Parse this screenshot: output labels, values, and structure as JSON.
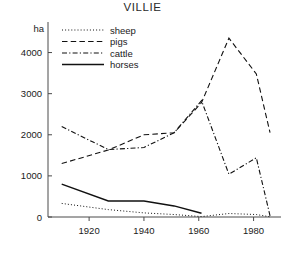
{
  "chart_data": {
    "type": "line",
    "title": "VILLIE",
    "xlabel": "",
    "ylabel": "ha",
    "xlim": [
      1905,
      1990
    ],
    "ylim": [
      0,
      4500
    ],
    "grid": false,
    "legend_position": "top-left",
    "xticks": [
      1920,
      1940,
      1960,
      1980
    ],
    "yticks": [
      0,
      1000,
      2000,
      3000,
      4000
    ],
    "series": [
      {
        "name": "sheep",
        "style": "dotted",
        "x": [
          1910,
          1927,
          1940,
          1951,
          1961,
          1971,
          1981,
          1986
        ],
        "values": [
          330,
          180,
          100,
          60,
          10,
          85,
          60,
          5
        ]
      },
      {
        "name": "pigs",
        "style": "dashed",
        "x": [
          1910,
          1927,
          1940,
          1951,
          1961,
          1971,
          1981,
          1986
        ],
        "values": [
          1300,
          1630,
          2000,
          2050,
          2780,
          4350,
          3480,
          2050
        ]
      },
      {
        "name": "cattle",
        "style": "dash-dot",
        "x": [
          1910,
          1927,
          1940,
          1951,
          1961,
          1971,
          1981,
          1986
        ],
        "values": [
          2200,
          1640,
          1690,
          2050,
          2830,
          1040,
          1440,
          30
        ]
      },
      {
        "name": "horses",
        "style": "solid",
        "x": [
          1910,
          1927,
          1940,
          1951,
          1961
        ],
        "values": [
          800,
          390,
          390,
          270,
          90
        ]
      }
    ]
  },
  "axes": {
    "y_unit_label": "ha",
    "y_tick_labels": [
      "0",
      "1000",
      "2000",
      "3000",
      "4000"
    ],
    "x_tick_labels": [
      "1920",
      "1940",
      "1960",
      "1980"
    ]
  },
  "legend": {
    "entries": [
      {
        "label": "sheep",
        "style": "dotted"
      },
      {
        "label": "pigs",
        "style": "dashed"
      },
      {
        "label": "cattle",
        "style": "dash-dot"
      },
      {
        "label": "horses",
        "style": "solid"
      }
    ]
  },
  "colors": {
    "ink": "#111111",
    "axis": "#4a4a4a",
    "background": "#ffffff"
  }
}
